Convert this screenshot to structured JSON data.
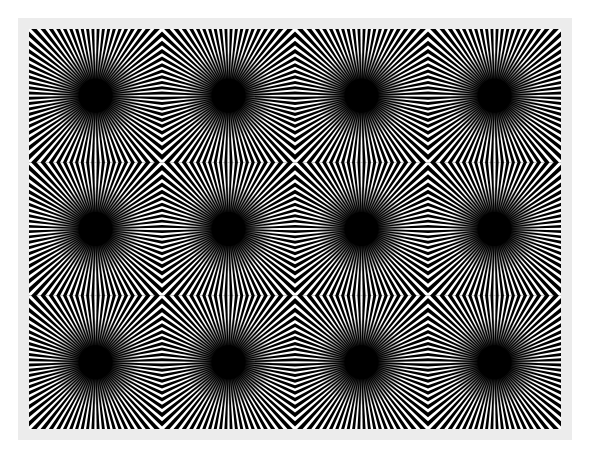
{
  "image": {
    "description": "Optical illusion: grid of radial starburst patterns with dark centers",
    "background": "#ffffff",
    "frame_color": "#ececec",
    "pattern_bg": "#000000",
    "ray_color": "#ffffff",
    "grid": {
      "cols": 4,
      "rows": 3
    },
    "tile_size": 133,
    "rays_per_burst": 80,
    "center_radius": 17
  }
}
